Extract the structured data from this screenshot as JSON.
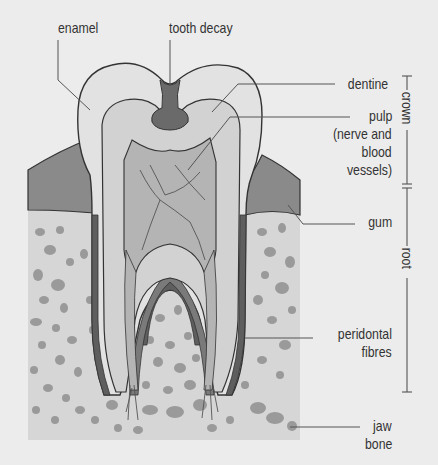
{
  "diagram": {
    "colors": {
      "background": "#ececec",
      "enamel": "#e2e2e2",
      "dentine": "#d2d2d2",
      "pulp": "#b4b4b4",
      "decay": "#6a6a6a",
      "gum": "#8a8a8a",
      "bone": "#d6d6d6",
      "bone_spots": "#9a9a9a",
      "outline": "#333333",
      "leader_line": "#555555"
    },
    "labels": {
      "enamel": "enamel",
      "tooth_decay": "tooth decay",
      "dentine": "dentine",
      "pulp_line1": "pulp",
      "pulp_line2": "(nerve and",
      "pulp_line3": "blood",
      "pulp_line4": "vessels)",
      "gum": "gum",
      "peridontal_line1": "peridontal",
      "peridontal_line2": "fibres",
      "jaw_line1": "jaw",
      "jaw_line2": "bone"
    },
    "brackets": {
      "crown": "crown",
      "root": "root"
    }
  }
}
